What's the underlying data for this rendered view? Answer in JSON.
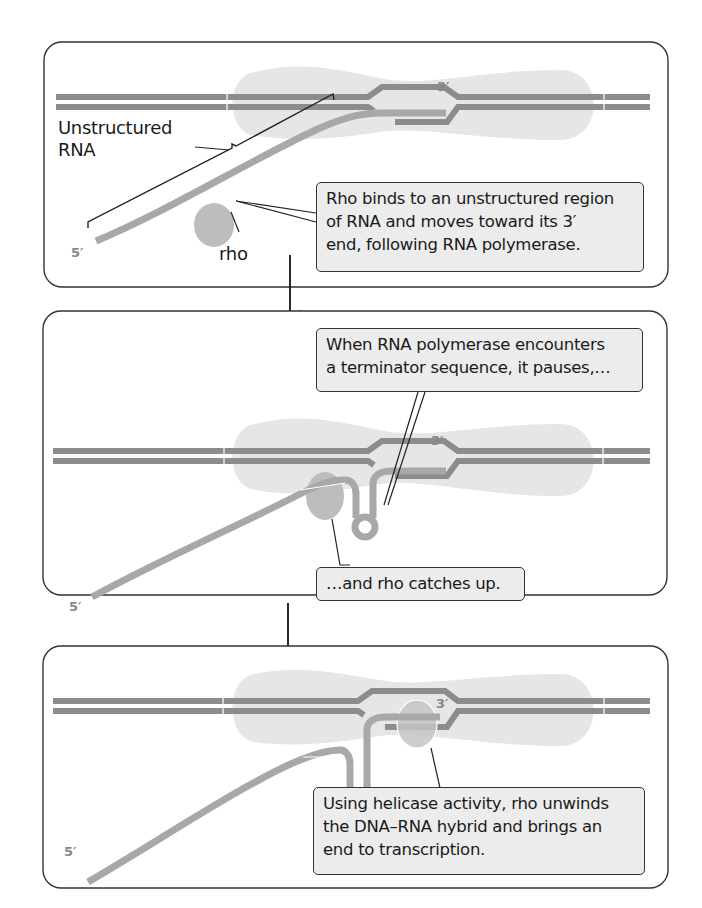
{
  "panels": [
    {
      "id": "step-1",
      "labels": {
        "unstructured_rna": "Unstructured RNA",
        "unstructured_rna_line1": "Unstructured",
        "unstructured_rna_line2": "RNA",
        "rho": "rho",
        "five_prime": "5′",
        "three_prime": "3′"
      },
      "callout": {
        "line1": "Rho binds to an unstructured region",
        "line2": "of RNA and moves toward its 3′",
        "line3": "end, following RNA polymerase."
      }
    },
    {
      "id": "step-2",
      "labels": {
        "five_prime": "5′",
        "three_prime": "3′"
      },
      "callout_top": {
        "line1": "When RNA polymerase encounters",
        "line2": "a terminator sequence, it pauses,…"
      },
      "callout_bottom": {
        "line1": "…and rho catches up."
      }
    },
    {
      "id": "step-3",
      "labels": {
        "five_prime": "5′",
        "three_prime": "3′"
      },
      "callout": {
        "line1": "Using helicase activity, rho unwinds",
        "line2": "the DNA–RNA hybrid and brings an",
        "line3": "end to transcription."
      }
    }
  ],
  "colors": {
    "dna": "#8c8c8c",
    "rna": "#a8a8a8",
    "polymerase": "#e6e6e6",
    "rho": "#bdbdbd",
    "panel_border": "#333333",
    "callout_bg": "#ececec",
    "text": "#1a1a1a",
    "prime_label": "#888888"
  }
}
